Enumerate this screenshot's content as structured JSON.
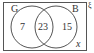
{
  "diagram": {
    "type": "venn",
    "universal_symbol": "ξ",
    "sets": [
      {
        "name": "G",
        "label": "G"
      },
      {
        "name": "B",
        "label": "B"
      }
    ],
    "regions": {
      "g_only": "7",
      "intersection": "23",
      "b_only": "15",
      "outside": "x"
    },
    "colors": {
      "stroke": "#555555",
      "text": "#333333",
      "background": "#ffffff"
    }
  }
}
